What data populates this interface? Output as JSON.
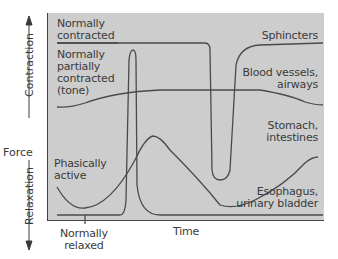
{
  "diagram": {
    "y_axis": {
      "label": "Force",
      "up_label": "Contraction",
      "down_label": "Relaxation"
    },
    "x_axis": {
      "label": "Time"
    },
    "left_labels": {
      "normally_contracted": "Normally contracted",
      "normally_contracted_l1": "Normally",
      "normally_contracted_l2": "contracted",
      "tone_l1": "Normally",
      "tone_l2": "partially",
      "tone_l3": "contracted",
      "tone_l4": "(tone)",
      "phasic_l1": "Phasically",
      "phasic_l2": "active",
      "relaxed_l1": "Normally",
      "relaxed_l2": "relaxed"
    },
    "right_labels": {
      "sphincters": "Sphincters",
      "blood_l1": "Blood vessels,",
      "blood_l2": "airways",
      "stomach_l1": "Stomach,",
      "stomach_l2": "intestines",
      "esoph_l1": "Esophagus,",
      "esoph_l2": "urinary bladder"
    },
    "colors": {
      "panel": "#cdcdcd",
      "line": "#4a4a4a",
      "text": "#3a3a3a"
    }
  }
}
